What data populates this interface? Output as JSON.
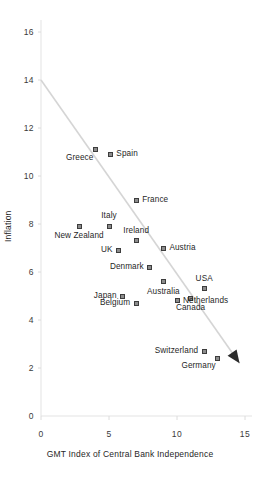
{
  "chart_data": {
    "type": "scatter",
    "title": "",
    "xlabel": "GMT Index of Central Bank Independence",
    "ylabel": "Inflation",
    "xlim": [
      0,
      15
    ],
    "ylim": [
      0,
      18
    ],
    "xticks": [
      "0",
      "5",
      "10",
      "15"
    ],
    "yticks": [
      "0",
      "2",
      "4",
      "6",
      "8",
      "10",
      "12",
      "14",
      "16",
      "18"
    ],
    "grid": false,
    "legend": "none",
    "marker": {
      "shape": "square",
      "fill": "#8c8c8c",
      "edge": "#3d3d3d"
    },
    "trendline": {
      "description": "downward sloping arrow from high inflation / low independence to low inflation / high independence",
      "x_start": 0.0,
      "y_start": 14.0,
      "x_end": 14.6,
      "y_end": 2.2,
      "color": "#d5d5d5",
      "arrowhead": true
    },
    "points": [
      {
        "label": "Portugal",
        "x": 2.8,
        "y": 17.5,
        "label_position": "right"
      },
      {
        "label": "Greece",
        "x": 4.0,
        "y": 11.1,
        "label_position": "below-left"
      },
      {
        "label": "Spain",
        "x": 5.1,
        "y": 10.9,
        "label_position": "right"
      },
      {
        "label": "France",
        "x": 7.0,
        "y": 9.0,
        "label_position": "right"
      },
      {
        "label": "Italy",
        "x": 5.0,
        "y": 7.9,
        "label_position": "above"
      },
      {
        "label": "New Zealand",
        "x": 2.8,
        "y": 7.9,
        "label_position": "below"
      },
      {
        "label": "Ireland",
        "x": 7.0,
        "y": 7.3,
        "label_position": "above"
      },
      {
        "label": "Austria",
        "x": 9.0,
        "y": 7.0,
        "label_position": "right"
      },
      {
        "label": "UK",
        "x": 5.7,
        "y": 6.9,
        "label_position": "left"
      },
      {
        "label": "Denmark",
        "x": 8.0,
        "y": 6.2,
        "label_position": "left"
      },
      {
        "label": "Australia",
        "x": 9.0,
        "y": 5.6,
        "label_position": "below"
      },
      {
        "label": "USA",
        "x": 12.0,
        "y": 5.3,
        "label_position": "above"
      },
      {
        "label": "Japan",
        "x": 6.0,
        "y": 5.0,
        "label_position": "left"
      },
      {
        "label": "Canada",
        "x": 11.0,
        "y": 4.9,
        "label_position": "below"
      },
      {
        "label": "Belgium",
        "x": 7.0,
        "y": 4.7,
        "label_position": "left"
      },
      {
        "label": "Netherlands",
        "x": 10.0,
        "y": 4.8,
        "label_position": "right"
      },
      {
        "label": "Switzerland",
        "x": 12.0,
        "y": 2.7,
        "label_position": "left"
      },
      {
        "label": "Germany",
        "x": 13.0,
        "y": 2.4,
        "label_position": "below-left"
      }
    ]
  },
  "axes": {
    "x_title": "GMT Index of Central Bank Independence",
    "y_title": "Inflation"
  }
}
